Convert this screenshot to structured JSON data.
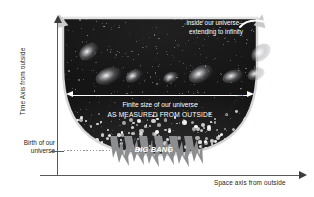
{
  "figure": {
    "axes": {
      "y_label": "Time Axis from outside",
      "x_label": "Space axis from outside"
    },
    "annotations": {
      "birth_line1": "Birth of our",
      "birth_line2": "universe",
      "space_callout_line1": "Space axis as seen from",
      "space_callout_line2": "inside our universe—",
      "space_callout_line3": "extending to infinity",
      "finite_line1": "Finite size of our universe",
      "finite_line2": "AS MEASURED FROM OUTSIDE",
      "big_bang": "BIG BANG",
      "inflaton_field": "Inflaton field"
    },
    "colors": {
      "universe_fill": "#141414",
      "page_background": "#ffffff",
      "axis": "#58595b",
      "text": "#231f20",
      "annotation_light": "#ffffff",
      "arrow_grey": "#c9cacb",
      "big_bang_spikes": "#8c8d8f"
    }
  }
}
